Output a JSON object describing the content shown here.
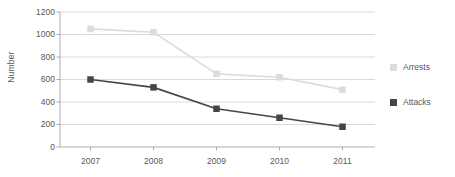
{
  "chart_data": {
    "type": "line",
    "title": "",
    "subtitle": "",
    "xlabel": "",
    "ylabel": "Number",
    "categories": [
      "2007",
      "2008",
      "2009",
      "2010",
      "2011"
    ],
    "series": [
      {
        "name": "Arrests",
        "color": "#dcdcdc",
        "marker": "square",
        "values": [
          1050,
          1020,
          650,
          620,
          510
        ]
      },
      {
        "name": "Attacks",
        "color": "#454545",
        "marker": "square",
        "values": [
          600,
          530,
          340,
          260,
          180
        ]
      }
    ],
    "ylim": [
      0,
      1200
    ],
    "y_ticks": [
      0,
      200,
      400,
      600,
      800,
      1000,
      1200
    ],
    "y_tick_labels": [
      "0",
      "200",
      "400",
      "600",
      "800",
      "1000",
      "1200"
    ],
    "grid": "horizontal",
    "legend_position": "right",
    "background": "#ffffff",
    "axis_color": "#9b9b9b",
    "gridline_color": "#c9c9c9",
    "text_color": "#58595b"
  },
  "legend": {
    "items": [
      {
        "label": "Arrests",
        "swatch": "legend-swatch-arrests"
      },
      {
        "label": "Attacks",
        "swatch": "legend-swatch-attacks"
      }
    ]
  }
}
